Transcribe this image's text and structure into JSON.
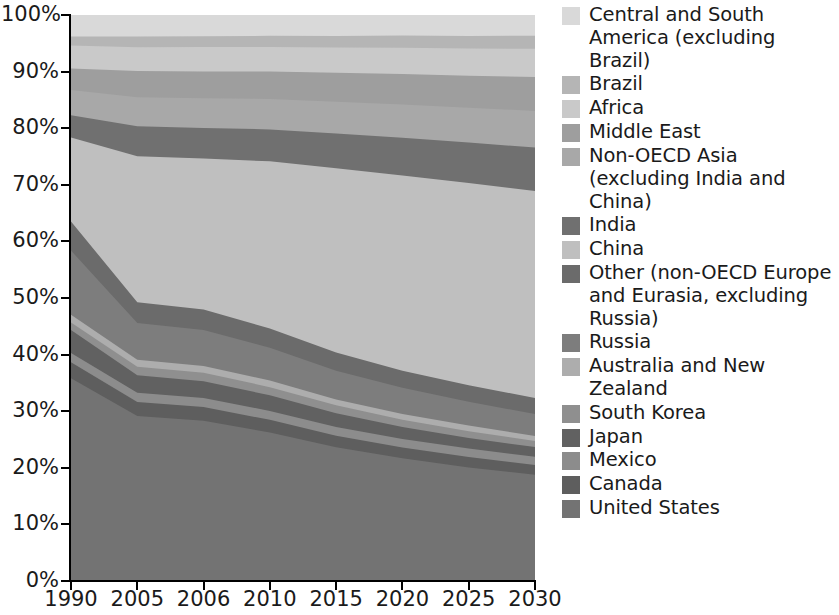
{
  "chart_data": {
    "type": "area",
    "stacked": true,
    "normalized": true,
    "title": "",
    "xlabel": "",
    "ylabel": "",
    "grid": false,
    "legend_position": "right",
    "categories": [
      "1990",
      "2005",
      "2006",
      "2010",
      "2015",
      "2020",
      "2025",
      "2030"
    ],
    "x_tick_labels": [
      "1990",
      "2005",
      "2006",
      "2010",
      "2015",
      "2020",
      "2025",
      "2030"
    ],
    "y_tick_labels": [
      "0%",
      "10%",
      "20%",
      "30%",
      "40%",
      "50%",
      "60%",
      "70%",
      "80%",
      "90%",
      "100%"
    ],
    "y_tick_values": [
      0,
      10,
      20,
      30,
      40,
      50,
      60,
      70,
      80,
      90,
      100
    ],
    "ylim": [
      0,
      100
    ],
    "series": [
      {
        "name": "United States",
        "color": "#737373",
        "values": [
          26.5,
          21.5,
          21.0,
          20.0,
          18.5,
          17.3,
          16.3,
          15.4
        ]
      },
      {
        "name": "Canada",
        "color": "#5e5e5e",
        "values": [
          2.1,
          1.8,
          1.8,
          1.7,
          1.6,
          1.5,
          1.5,
          1.4
        ]
      },
      {
        "name": "Mexico",
        "color": "#8c8c8c",
        "values": [
          1.2,
          1.2,
          1.2,
          1.2,
          1.2,
          1.2,
          1.2,
          1.2
        ]
      },
      {
        "name": "Japan",
        "color": "#616161",
        "values": [
          3.0,
          2.3,
          2.2,
          2.1,
          1.9,
          1.7,
          1.5,
          1.4
        ]
      },
      {
        "name": "South Korea",
        "color": "#8f8f8f",
        "values": [
          1.0,
          1.1,
          1.1,
          1.1,
          1.1,
          1.0,
          1.0,
          0.9
        ]
      },
      {
        "name": "Australia and New Zealand",
        "color": "#adadad",
        "values": [
          1.0,
          0.9,
          0.9,
          0.9,
          0.8,
          0.8,
          0.8,
          0.7
        ]
      },
      {
        "name": "Russia",
        "color": "#7d7d7d",
        "values": [
          8.4,
          4.8,
          4.7,
          4.4,
          4.0,
          3.7,
          3.4,
          3.2
        ]
      },
      {
        "name": "Other (non-OECD Europe and Eurasia, excluding Russia)",
        "color": "#6b6b6b",
        "values": [
          3.8,
          2.7,
          2.7,
          2.6,
          2.5,
          2.4,
          2.4,
          2.3
        ]
      },
      {
        "name": "China",
        "color": "#bfbfbf",
        "values": [
          11.0,
          19.0,
          19.8,
          22.5,
          25.5,
          27.5,
          29.0,
          30.0
        ]
      },
      {
        "name": "India",
        "color": "#707070",
        "values": [
          2.9,
          3.9,
          4.0,
          4.3,
          4.8,
          5.3,
          5.8,
          6.3
        ]
      },
      {
        "name": "Non-OECD Asia (excluding India and China)",
        "color": "#a8a8a8",
        "values": [
          3.3,
          3.8,
          3.9,
          4.1,
          4.4,
          4.7,
          5.0,
          5.3
        ]
      },
      {
        "name": "Middle East",
        "color": "#9e9e9e",
        "values": [
          2.8,
          3.4,
          3.5,
          3.7,
          4.0,
          4.3,
          4.6,
          4.9
        ]
      },
      {
        "name": "Africa",
        "color": "#c9c9c9",
        "values": [
          3.0,
          3.1,
          3.2,
          3.3,
          3.5,
          3.7,
          3.9,
          4.1
        ]
      },
      {
        "name": "Brazil",
        "color": "#b5b5b5",
        "values": [
          1.2,
          1.4,
          1.4,
          1.5,
          1.6,
          1.7,
          1.8,
          1.9
        ]
      },
      {
        "name": "Central and South America (excluding Brazil)",
        "color": "#d9d9d9",
        "values": [
          2.8,
          2.8,
          2.8,
          2.8,
          2.9,
          2.9,
          3.0,
          3.0
        ]
      }
    ]
  },
  "legend": {
    "items": [
      {
        "label": "Central and South America (excluding Brazil)",
        "color": "#d9d9d9"
      },
      {
        "label": "Brazil",
        "color": "#b5b5b5"
      },
      {
        "label": "Africa",
        "color": "#c9c9c9"
      },
      {
        "label": "Middle East",
        "color": "#9e9e9e"
      },
      {
        "label": "Non-OECD Asia (excluding India and China)",
        "color": "#a8a8a8"
      },
      {
        "label": "India",
        "color": "#707070"
      },
      {
        "label": "China",
        "color": "#bfbfbf"
      },
      {
        "label": "Other (non-OECD Europe and Eurasia, excluding Russia)",
        "color": "#6b6b6b"
      },
      {
        "label": "Russia",
        "color": "#7d7d7d"
      },
      {
        "label": "Australia and New Zealand",
        "color": "#adadad"
      },
      {
        "label": "South Korea",
        "color": "#8f8f8f"
      },
      {
        "label": "Japan",
        "color": "#616161"
      },
      {
        "label": "Mexico",
        "color": "#8c8c8c"
      },
      {
        "label": "Canada",
        "color": "#5e5e5e"
      },
      {
        "label": "United States",
        "color": "#737373"
      }
    ]
  }
}
